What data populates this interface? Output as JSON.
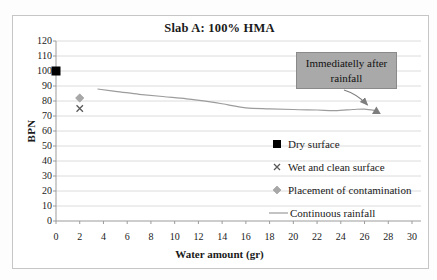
{
  "chart_data": {
    "type": "line",
    "title": "Slab A: 100% HMA",
    "xlabel": "Water amount (gr)",
    "ylabel": "BPN",
    "xlim": [
      0,
      30
    ],
    "ylim": [
      0,
      120
    ],
    "xticks": [
      0,
      2,
      4,
      6,
      8,
      10,
      12,
      14,
      16,
      18,
      20,
      22,
      24,
      26,
      28,
      30
    ],
    "yticks": [
      0,
      10,
      20,
      30,
      40,
      50,
      60,
      70,
      80,
      90,
      100,
      110,
      120
    ],
    "grid": "horizontal",
    "legend_position": "inside-right",
    "series": [
      {
        "name": "Dry surface",
        "type": "scatter",
        "marker": "square",
        "color": "#000000",
        "points": [
          [
            0,
            100
          ]
        ]
      },
      {
        "name": "Wet and clean surface",
        "type": "scatter",
        "marker": "x",
        "color": "#595959",
        "points": [
          [
            2,
            75
          ]
        ]
      },
      {
        "name": "Placement of contamination",
        "type": "scatter",
        "marker": "diamond",
        "color": "#a8a8a8",
        "points": [
          [
            2,
            82
          ]
        ]
      },
      {
        "name": "Continuous rainfall",
        "type": "line",
        "color": "#9c9c9c",
        "points": [
          [
            3.5,
            88
          ],
          [
            5,
            86.5
          ],
          [
            7,
            84.5
          ],
          [
            9,
            83
          ],
          [
            11,
            81.5
          ],
          [
            13,
            79.5
          ],
          [
            14.5,
            77.5
          ],
          [
            16,
            75.5
          ],
          [
            18,
            74.8
          ],
          [
            20,
            74.3
          ],
          [
            22,
            74
          ],
          [
            23.5,
            73.6
          ],
          [
            25,
            74.3
          ],
          [
            26,
            74.6
          ],
          [
            27,
            73.5
          ]
        ],
        "end_marker": "triangle",
        "end_marker_color": "#7d7d7d"
      }
    ],
    "annotation": {
      "text": "Immediatelly after rainfall",
      "target_point": [
        27,
        73.5
      ],
      "box_fill": "#a9a9a9",
      "box_border": "#8a8a8a",
      "arrow_color": "#7d7d7d",
      "text_color": "#111111"
    },
    "colors": {
      "gridline": "#dcdcdc",
      "axis": "#9b9b9b",
      "frame_border": "#c6c6c6",
      "background": "#ffffff"
    }
  }
}
